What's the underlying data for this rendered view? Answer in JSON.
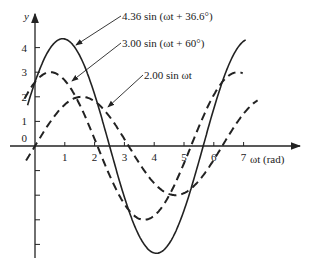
{
  "chart_data": {
    "type": "line",
    "title": "",
    "xlabel": "ωt (rad)",
    "ylabel": "y",
    "xlim": [
      -0.3,
      8.2
    ],
    "ylim": [
      -4.6,
      5.2
    ],
    "grid": false,
    "x_ticks": [
      "1",
      "2",
      "3",
      "4",
      "5",
      "6",
      "7"
    ],
    "y_ticks": [
      "0",
      "1",
      "2",
      "3",
      "4"
    ],
    "series": [
      {
        "name": "4.36 sin (ωt + 36.6°)",
        "amplitude": 4.36,
        "phase_deg": 36.6,
        "style": "solid",
        "x_range": [
          -0.25,
          7.1
        ]
      },
      {
        "name": "3.00 sin (ωt + 60°)",
        "amplitude": 3.0,
        "phase_deg": 60,
        "style": "dashed",
        "x_range": [
          -0.35,
          7.0
        ]
      },
      {
        "name": "2.00 sin ωt",
        "amplitude": 2.0,
        "phase_deg": 0,
        "style": "dashed",
        "x_range": [
          -0.3,
          7.5
        ]
      }
    ],
    "annotations": [
      {
        "text": "4.36 sin (ωt + 36.6°)",
        "label_xy": [
          121,
          18
        ],
        "arrow_to": [
          76,
          45
        ]
      },
      {
        "text": "3.00 sin (ωt + 60°)",
        "label_xy": [
          121,
          45
        ],
        "arrow_to": [
          72,
          81
        ]
      },
      {
        "text": "2.00 sin ωt",
        "label_xy": [
          143,
          77
        ],
        "arrow_to": [
          108,
          107
        ]
      }
    ]
  }
}
